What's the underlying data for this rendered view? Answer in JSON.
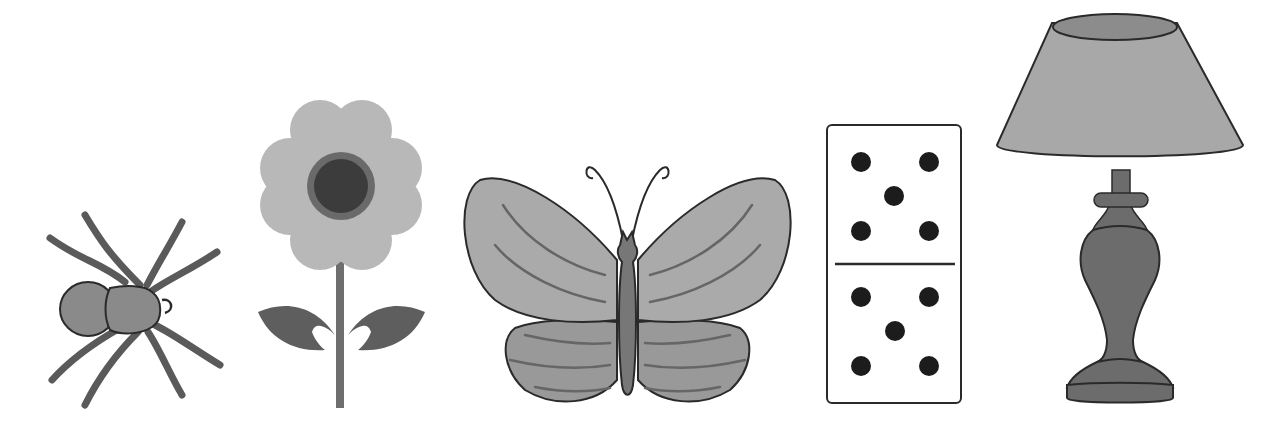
{
  "scene": {
    "background": "#ffffff",
    "objects": [
      {
        "id": "spider",
        "label": "spider",
        "index": 1
      },
      {
        "id": "flower",
        "label": "flower",
        "index": 2
      },
      {
        "id": "butterfly",
        "label": "butterfly",
        "index": 3
      },
      {
        "id": "domino",
        "label": "domino",
        "index": 4,
        "top_pips": 5,
        "bottom_pips": 5
      },
      {
        "id": "lamp",
        "label": "lamp",
        "index": 5
      }
    ]
  },
  "colors": {
    "outline": "#2a2a2a",
    "spider_body": "#8a8a8a",
    "spider_legs": "#5a5a5a",
    "petal": "#b8b8b8",
    "flower_center": "#3c3c3c",
    "flower_ring": "#6a6a6a",
    "leaf": "#5e5e5e",
    "stem": "#6e6e6e",
    "wing_upper": "#aaaaaa",
    "wing_lower": "#999999",
    "wing_vein": "#666666",
    "butterfly_body": "#777777",
    "domino_face": "#ffffff",
    "pip": "#1c1c1c",
    "shade": "#a8a8a8",
    "shade_top": "#8c8c8c",
    "lamp_base": "#6c6c6c"
  }
}
